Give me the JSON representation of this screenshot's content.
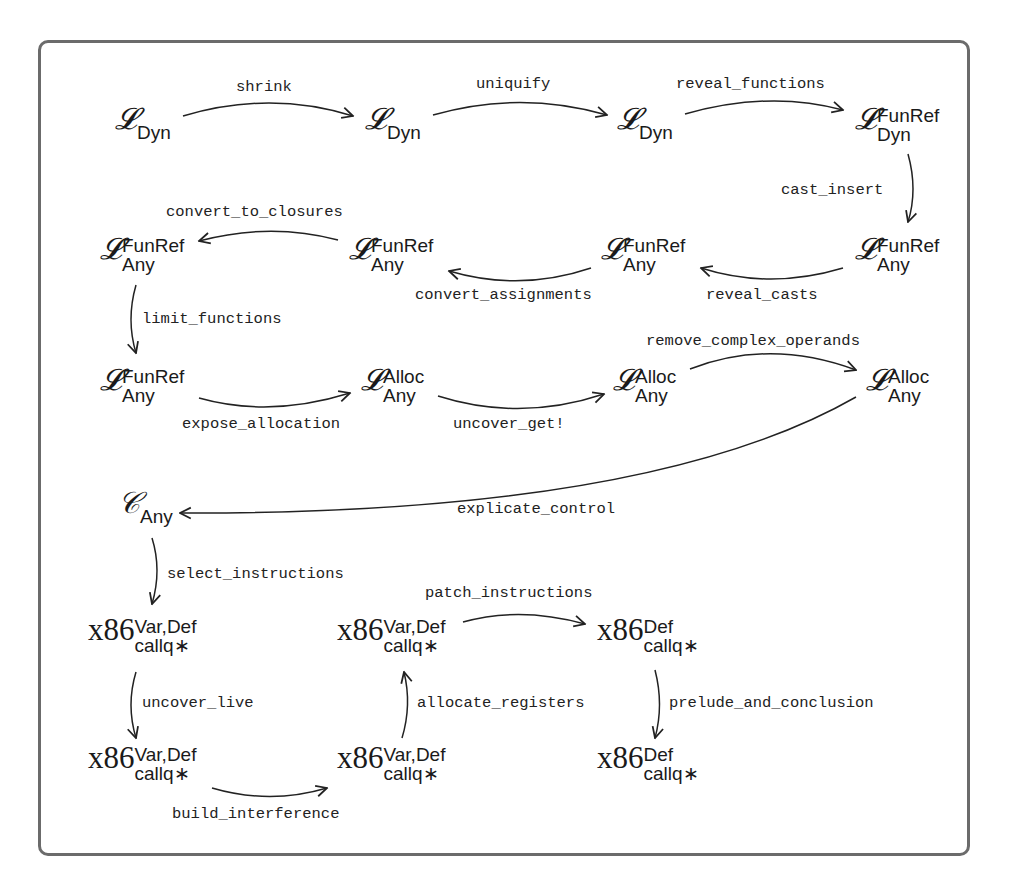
{
  "diagram": {
    "nodes": [
      {
        "id": "n1",
        "base": "𝓛",
        "sup": "",
        "sub": "Dyn"
      },
      {
        "id": "n2",
        "base": "𝓛",
        "sup": "",
        "sub": "Dyn"
      },
      {
        "id": "n3",
        "base": "𝓛",
        "sup": "",
        "sub": "Dyn"
      },
      {
        "id": "n4",
        "base": "𝓛",
        "sup": "FunRef",
        "sub": "Dyn"
      },
      {
        "id": "n5",
        "base": "𝓛",
        "sup": "FunRef",
        "sub": "Any"
      },
      {
        "id": "n6",
        "base": "𝓛",
        "sup": "FunRef",
        "sub": "Any"
      },
      {
        "id": "n7",
        "base": "𝓛",
        "sup": "FunRef",
        "sub": "Any"
      },
      {
        "id": "n8",
        "base": "𝓛",
        "sup": "FunRef",
        "sub": "Any"
      },
      {
        "id": "n9",
        "base": "𝓛",
        "sup": "FunRef",
        "sub": "Any"
      },
      {
        "id": "n10",
        "base": "𝓛",
        "sup": "Alloc",
        "sub": "Any"
      },
      {
        "id": "n11",
        "base": "𝓛",
        "sup": "Alloc",
        "sub": "Any"
      },
      {
        "id": "n12",
        "base": "𝓛",
        "sup": "Alloc",
        "sub": "Any"
      },
      {
        "id": "n13",
        "base": "𝒞",
        "sup": "",
        "sub": "Any"
      },
      {
        "id": "n14",
        "base": "x86",
        "sup": "Var,Def",
        "sub": "callq∗"
      },
      {
        "id": "n15",
        "base": "x86",
        "sup": "Var,Def",
        "sub": "callq∗"
      },
      {
        "id": "n16",
        "base": "x86",
        "sup": "Def",
        "sub": "callq∗"
      },
      {
        "id": "n17",
        "base": "x86",
        "sup": "Var,Def",
        "sub": "callq∗"
      },
      {
        "id": "n18",
        "base": "x86",
        "sup": "Var,Def",
        "sub": "callq∗"
      },
      {
        "id": "n19",
        "base": "x86",
        "sup": "Def",
        "sub": "callq∗"
      }
    ],
    "edges": [
      {
        "from": "n1",
        "to": "n2",
        "label": "shrink"
      },
      {
        "from": "n2",
        "to": "n3",
        "label": "uniquify"
      },
      {
        "from": "n3",
        "to": "n4",
        "label": "reveal_functions"
      },
      {
        "from": "n4",
        "to": "n8",
        "label": "cast_insert"
      },
      {
        "from": "n8",
        "to": "n7",
        "label": "reveal_casts"
      },
      {
        "from": "n7",
        "to": "n6",
        "label": "convert_assignments"
      },
      {
        "from": "n6",
        "to": "n5",
        "label": "convert_to_closures"
      },
      {
        "from": "n5",
        "to": "n9",
        "label": "limit_functions"
      },
      {
        "from": "n9",
        "to": "n10",
        "label": "expose_allocation"
      },
      {
        "from": "n10",
        "to": "n11",
        "label": "uncover_get!"
      },
      {
        "from": "n11",
        "to": "n12",
        "label": "remove_complex_operands"
      },
      {
        "from": "n12",
        "to": "n13",
        "label": "explicate_control"
      },
      {
        "from": "n13",
        "to": "n14",
        "label": "select_instructions"
      },
      {
        "from": "n14",
        "to": "n17",
        "label": "uncover_live"
      },
      {
        "from": "n17",
        "to": "n18",
        "label": "build_interference"
      },
      {
        "from": "n18",
        "to": "n15",
        "label": "allocate_registers"
      },
      {
        "from": "n15",
        "to": "n16",
        "label": "patch_instructions"
      },
      {
        "from": "n16",
        "to": "n19",
        "label": "prelude_and_conclusion"
      }
    ]
  },
  "colors": {
    "border": "#6b6b6b",
    "ink": "#1a1a1a"
  }
}
